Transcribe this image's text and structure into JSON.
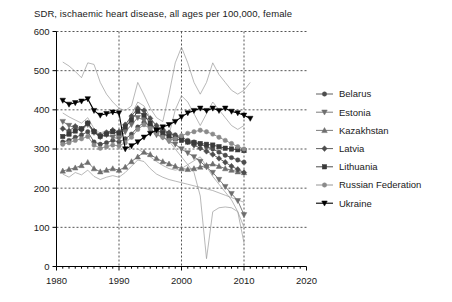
{
  "chart_data": {
    "type": "line",
    "title": "SDR, ischaemic heart disease, all ages per 100,000, female",
    "xlabel": "",
    "ylabel": "",
    "xlim": [
      1980,
      2020
    ],
    "ylim": [
      0,
      600
    ],
    "xticks": [
      "1980",
      "1990",
      "2000",
      "2010",
      "2020"
    ],
    "xtick_values": [
      1980,
      1990,
      2000,
      2010,
      2020
    ],
    "yticks": [
      "0",
      "100",
      "200",
      "300",
      "400",
      "500",
      "600"
    ],
    "ytick_values": [
      0,
      100,
      200,
      300,
      400,
      500,
      600
    ],
    "x_minor_step": 1,
    "grid": true,
    "grid_style": "dashed",
    "legend_position": "right",
    "series": [
      {
        "name": "Belarus",
        "marker": "circle",
        "color": "#4d4d4d",
        "x": [
          1981,
          1982,
          1983,
          1984,
          1985,
          1986,
          1987,
          1988,
          1989,
          1990,
          1991,
          1992,
          1993,
          1994,
          1995,
          1996,
          1997,
          1998,
          1999,
          2000,
          2001,
          2002,
          2003,
          2004,
          2005,
          2006,
          2007,
          2008,
          2009,
          2010
        ],
        "y": [
          318,
          322,
          330,
          336,
          344,
          318,
          312,
          316,
          322,
          318,
          326,
          338,
          356,
          368,
          360,
          352,
          346,
          340,
          336,
          330,
          322,
          318,
          312,
          306,
          300,
          292,
          284,
          278,
          272,
          266
        ]
      },
      {
        "name": "Estonia",
        "marker": "triangle-down",
        "color": "#6e6e6e",
        "x": [
          1981,
          1982,
          1983,
          1984,
          1985,
          1986,
          1987,
          1988,
          1989,
          1990,
          1991,
          1992,
          1993,
          1994,
          1995,
          1996,
          1997,
          1998,
          1999,
          2000,
          2001,
          2002,
          2003,
          2004,
          2005,
          2006,
          2007,
          2008,
          2009,
          2010
        ],
        "y": [
          370,
          360,
          354,
          348,
          362,
          342,
          330,
          336,
          330,
          326,
          344,
          362,
          380,
          374,
          352,
          336,
          330,
          320,
          312,
          300,
          290,
          280,
          268,
          254,
          240,
          222,
          204,
          186,
          168,
          132
        ]
      },
      {
        "name": "Kazakhstan",
        "marker": "triangle-up",
        "color": "#6e6e6e",
        "x": [
          1981,
          1982,
          1983,
          1984,
          1985,
          1986,
          1987,
          1988,
          1989,
          1990,
          1991,
          1992,
          1993,
          1994,
          1995,
          1996,
          1997,
          1998,
          1999,
          2000,
          2001,
          2002,
          2003,
          2004,
          2005,
          2006,
          2007,
          2008,
          2009,
          2010
        ],
        "y": [
          244,
          248,
          252,
          258,
          266,
          250,
          242,
          246,
          250,
          246,
          254,
          268,
          280,
          292,
          286,
          276,
          268,
          262,
          256,
          250,
          248,
          250,
          254,
          258,
          262,
          256,
          250,
          246,
          242,
          240
        ]
      },
      {
        "name": "Latvia",
        "marker": "diamond",
        "color": "#4d4d4d",
        "x": [
          1981,
          1982,
          1983,
          1984,
          1985,
          1986,
          1987,
          1988,
          1989,
          1990,
          1991,
          1992,
          1993,
          1994,
          1995,
          1996,
          1997,
          1998,
          1999,
          2000,
          2001,
          2002,
          2003,
          2004,
          2005,
          2006,
          2007,
          2008,
          2009,
          2010
        ],
        "y": [
          352,
          346,
          358,
          350,
          366,
          346,
          336,
          342,
          348,
          344,
          362,
          384,
          404,
          398,
          378,
          360,
          350,
          342,
          334,
          326,
          318,
          310,
          302,
          294,
          286,
          276,
          266,
          256,
          248,
          240
        ]
      },
      {
        "name": "Lithuania",
        "marker": "square",
        "color": "#3a3a3a",
        "x": [
          1981,
          1982,
          1983,
          1984,
          1985,
          1986,
          1987,
          1988,
          1989,
          1990,
          1991,
          1992,
          1993,
          1994,
          1995,
          1996,
          1997,
          1998,
          1999,
          2000,
          2001,
          2002,
          2003,
          2004,
          2005,
          2006,
          2007,
          2008,
          2009,
          2010
        ],
        "y": [
          332,
          338,
          346,
          352,
          366,
          344,
          332,
          338,
          344,
          340,
          356,
          374,
          396,
          386,
          366,
          348,
          340,
          332,
          326,
          322,
          318,
          316,
          314,
          312,
          310,
          306,
          302,
          300,
          298,
          296
        ]
      },
      {
        "name": "Russian Federation",
        "marker": "circle",
        "color": "#8a8a8a",
        "x": [
          1981,
          1982,
          1983,
          1984,
          1985,
          1986,
          1987,
          1988,
          1989,
          1990,
          1991,
          1992,
          1993,
          1994,
          1995,
          1996,
          1997,
          1998,
          1999,
          2000,
          2001,
          2002,
          2003,
          2004,
          2005,
          2006,
          2007,
          2008,
          2009,
          2010
        ],
        "y": [
          312,
          316,
          322,
          326,
          332,
          310,
          302,
          306,
          310,
          308,
          316,
          330,
          350,
          362,
          352,
          340,
          330,
          322,
          326,
          334,
          340,
          344,
          348,
          344,
          338,
          330,
          322,
          314,
          306,
          300
        ]
      },
      {
        "name": "Ukraine",
        "marker": "triangle-down",
        "color": "#000000",
        "x": [
          1981,
          1982,
          1983,
          1984,
          1985,
          1986,
          1987,
          1988,
          1989,
          1990,
          1991,
          1992,
          1993,
          1994,
          1995,
          1996,
          1997,
          1998,
          1999,
          2000,
          2001,
          2002,
          2003,
          2004,
          2005,
          2006,
          2007,
          2008,
          2009,
          2010,
          2011
        ],
        "y": [
          424,
          414,
          418,
          422,
          428,
          398,
          386,
          390,
          394,
          392,
          300,
          308,
          318,
          330,
          340,
          348,
          356,
          362,
          370,
          382,
          392,
          398,
          404,
          398,
          404,
          398,
          404,
          396,
          392,
          386,
          378
        ]
      }
    ],
    "background_series": [
      {
        "name": "unlabelled-high",
        "x": [
          1981,
          1982,
          1983,
          1984,
          1985,
          1986,
          1987,
          1988,
          1989,
          1990,
          1991,
          1992,
          1993,
          1994,
          1995,
          1996,
          1997,
          1998,
          1999,
          2000,
          2001,
          2002,
          2003,
          2004,
          2005,
          2006,
          2007,
          2008,
          2009,
          2010,
          2011
        ],
        "y": [
          522,
          512,
          498,
          482,
          520,
          516,
          470,
          440,
          420,
          404,
          398,
          410,
          470,
          438,
          404,
          380,
          370,
          440,
          520,
          560,
          520,
          470,
          440,
          470,
          520,
          490,
          470,
          450,
          440,
          450,
          470
        ]
      },
      {
        "name": "unlabelled-mid",
        "x": [
          1981,
          1982,
          1983,
          1984,
          1985,
          1986,
          1987,
          1988,
          1989,
          1990,
          1991,
          1992,
          1993,
          1994,
          1995,
          1996,
          1997,
          1998,
          1999,
          2000,
          2001,
          2002,
          2003,
          2004,
          2005,
          2006,
          2007,
          2008,
          2009,
          2010
        ],
        "y": [
          392,
          382,
          374,
          366,
          380,
          352,
          340,
          348,
          340,
          330,
          352,
          388,
          420,
          410,
          380,
          356,
          344,
          336,
          400,
          436,
          420,
          390,
          360,
          390,
          420,
          400,
          380,
          360,
          350,
          360
        ]
      },
      {
        "name": "unlabelled-low",
        "x": [
          1981,
          1982,
          1983,
          1984,
          1985,
          1986,
          1987,
          1988,
          1989,
          1990,
          1991,
          1992,
          1993,
          1994,
          1995,
          1996,
          1997,
          1998,
          1999,
          2000,
          2001,
          2002,
          2003,
          2004,
          2005,
          2006,
          2007,
          2008,
          2009,
          2010
        ],
        "y": [
          236,
          228,
          240,
          234,
          246,
          230,
          222,
          228,
          232,
          228,
          240,
          256,
          272,
          268,
          250,
          236,
          228,
          222,
          218,
          214,
          210,
          206,
          202,
          198,
          194,
          188,
          182,
          176,
          170,
          164
        ]
      },
      {
        "name": "unlabelled-crash",
        "x": [
          1998,
          1999,
          2000,
          2001,
          2002,
          2003,
          2004,
          2005,
          2006,
          2007,
          2008,
          2009,
          2010
        ],
        "y": [
          320,
          300,
          280,
          260,
          240,
          180,
          20,
          140,
          150,
          152,
          150,
          140,
          60
        ]
      },
      {
        "name": "unlabelled-dip",
        "x": [
          1993,
          1994,
          1995,
          1996,
          1997,
          1998,
          1999,
          2000,
          2001,
          2002,
          2003,
          2004,
          2005,
          2006,
          2007,
          2008,
          2009,
          2010
        ],
        "y": [
          300,
          290,
          280,
          268,
          258,
          250,
          246,
          250,
          260,
          270,
          280,
          255,
          230,
          210,
          190,
          170,
          140,
          100
        ]
      }
    ]
  },
  "legend": {
    "items": [
      {
        "label": "Belarus"
      },
      {
        "label": "Estonia"
      },
      {
        "label": "Kazakhstan"
      },
      {
        "label": "Latvia"
      },
      {
        "label": "Lithuania"
      },
      {
        "label": "Russian Federation"
      },
      {
        "label": "Ukraine"
      }
    ]
  }
}
